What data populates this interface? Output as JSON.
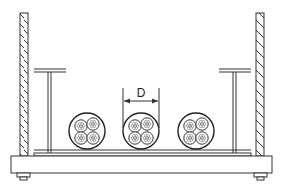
{
  "diagram": {
    "dimension_label": "D",
    "colors": {
      "stroke": "#333333",
      "background": "#ffffff"
    },
    "elements": {
      "left_wall": "hatched-wall",
      "right_wall": "hatched-wall",
      "left_support": "t-support",
      "right_support": "t-support",
      "base_plate": "base-plate",
      "cables": [
        {
          "name": "cable-group-left",
          "type": "trefoil"
        },
        {
          "name": "cable-group-middle",
          "type": "trefoil"
        },
        {
          "name": "cable-group-right",
          "type": "trefoil"
        }
      ]
    }
  }
}
